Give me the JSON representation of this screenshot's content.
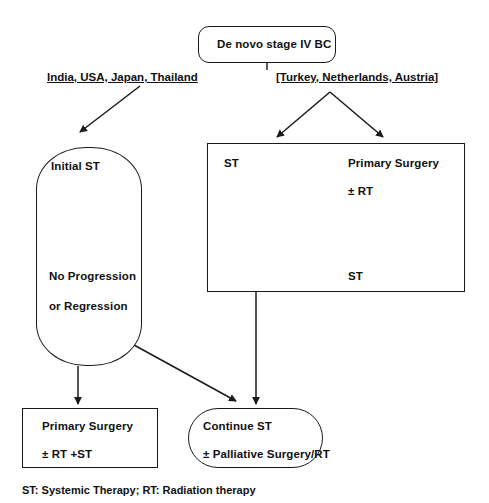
{
  "diagram": {
    "title_node": {
      "label": "De novo stage IV BC"
    },
    "branch_labels": {
      "left": "India, USA, Japan, Thailand",
      "right": "[Turkey, Netherlands, Austria]"
    },
    "left_pathway": {
      "step_1": "Initial ST",
      "step_2": "No Progression",
      "step_3": "or Regression"
    },
    "right_pathway": {
      "option_a": "ST",
      "option_b_line1": "Primary Surgery",
      "option_b_line2": "± RT",
      "option_b_outcome": "ST"
    },
    "outcomes": {
      "left_line1": "Primary Surgery",
      "left_line2": "± RT +ST",
      "right_line1": "Continue ST",
      "right_line2": "± Palliative Surgery/RT"
    },
    "footer": "ST: Systemic Therapy; RT: Radiation therapy",
    "colors": {
      "stroke": "#1a1a1a",
      "background": "#ffffff",
      "text": "#111111"
    }
  }
}
